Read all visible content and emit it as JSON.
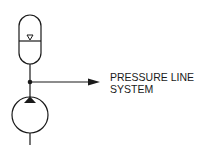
{
  "diagram": {
    "type": "hydraulic-schematic",
    "components": [
      {
        "name": "accumulator",
        "symbol": "gas-charged accumulator"
      },
      {
        "name": "pump",
        "symbol": "fixed displacement pump"
      },
      {
        "name": "junction",
        "symbol": "connection dot"
      },
      {
        "name": "outlet-arrow",
        "symbol": "flow arrow"
      }
    ],
    "label": {
      "line1": "PRESSURE LINE",
      "line2": "SYSTEM"
    },
    "colors": {
      "stroke": "#1a1a1a",
      "background": "#ffffff"
    }
  }
}
